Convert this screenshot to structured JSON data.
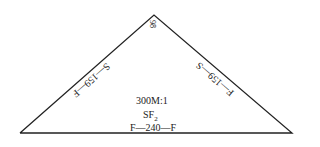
{
  "diagram": {
    "type": "molecular-geometry-triangle",
    "apex_angle": "98",
    "left_edge_label": "S—159—F",
    "right_edge_label": "F—159—S",
    "center": {
      "line1": "300M:1",
      "line2_main": "SF",
      "line2_sub": "2",
      "line3": "F—240—F"
    },
    "stroke_color": "#222222"
  }
}
